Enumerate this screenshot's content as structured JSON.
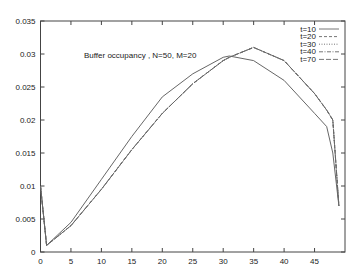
{
  "chart_data": {
    "type": "line",
    "title": "Buffer occupancy , N=50, M=20",
    "xlabel": "",
    "ylabel": "",
    "xlim": [
      0,
      50
    ],
    "ylim": [
      0,
      0.035
    ],
    "grid": false,
    "legend_position": "top-right",
    "x_ticks": [
      "0",
      "5",
      "10",
      "15",
      "20",
      "25",
      "30",
      "35",
      "40",
      "45"
    ],
    "y_ticks": [
      "0",
      "0.005",
      "0.01",
      "0.015",
      "0.02",
      "0.025",
      "0.03",
      "0.035"
    ],
    "x": [
      0,
      1,
      5,
      10,
      15,
      20,
      25,
      30,
      31,
      35,
      40,
      45,
      47,
      48,
      49
    ],
    "series": [
      {
        "name": "t=10",
        "style": "solid",
        "values": [
          0.01,
          0.001,
          0.0045,
          0.011,
          0.0175,
          0.0235,
          0.027,
          0.0295,
          0.0297,
          0.029,
          0.026,
          0.021,
          0.019,
          0.015,
          0.007
        ]
      },
      {
        "name": "t=20",
        "style": "dashed",
        "values": [
          0.01,
          0.001,
          0.004,
          0.0095,
          0.0155,
          0.021,
          0.0255,
          0.029,
          0.0295,
          0.031,
          0.029,
          0.024,
          0.0215,
          0.02,
          0.007
        ]
      },
      {
        "name": "t=30",
        "style": "dotted",
        "values": [
          0.01,
          0.001,
          0.004,
          0.0095,
          0.0155,
          0.021,
          0.0255,
          0.029,
          0.0295,
          0.031,
          0.029,
          0.024,
          0.0215,
          0.02,
          0.007
        ]
      },
      {
        "name": "t=40",
        "style": "dash-dot",
        "values": [
          0.01,
          0.001,
          0.004,
          0.0095,
          0.0155,
          0.021,
          0.0255,
          0.029,
          0.0295,
          0.031,
          0.029,
          0.024,
          0.0215,
          0.02,
          0.007
        ]
      },
      {
        "name": "t=70",
        "style": "long-dash",
        "values": [
          0.01,
          0.001,
          0.004,
          0.0095,
          0.0155,
          0.021,
          0.0255,
          0.029,
          0.0295,
          0.031,
          0.029,
          0.024,
          0.0215,
          0.02,
          0.007
        ]
      }
    ]
  }
}
